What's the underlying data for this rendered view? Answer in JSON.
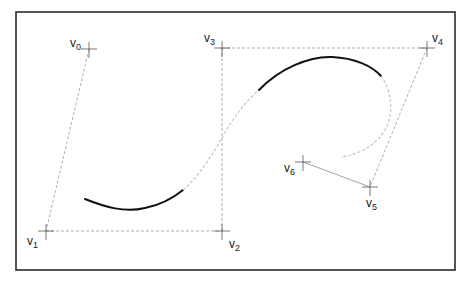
{
  "diagram": {
    "title": "",
    "frame": {
      "x": 16,
      "y": 12,
      "width": 439,
      "height": 258
    },
    "colors": {
      "frame": "#2a2a2a",
      "control_polygon": "#9a9a9a",
      "curve_active": "#111111",
      "curve_inactive": "#c4c4c4",
      "label": "#222222"
    },
    "control_points": [
      {
        "id": "v0",
        "letter": "V",
        "index": "0",
        "x": 89,
        "y": 49,
        "label_x": 70,
        "label_y": 47
      },
      {
        "id": "v1",
        "letter": "V",
        "index": "1",
        "x": 46,
        "y": 231,
        "label_x": 27,
        "label_y": 245
      },
      {
        "id": "v2",
        "letter": "V",
        "index": "2",
        "x": 222,
        "y": 231,
        "label_x": 229,
        "label_y": 248
      },
      {
        "id": "v3",
        "letter": "V",
        "index": "3",
        "x": 222,
        "y": 48,
        "label_x": 204,
        "label_y": 42
      },
      {
        "id": "v4",
        "letter": "V",
        "index": "4",
        "x": 427,
        "y": 48,
        "label_x": 432,
        "label_y": 42
      },
      {
        "id": "v5",
        "letter": "V",
        "index": "5",
        "x": 370,
        "y": 187,
        "label_x": 366,
        "label_y": 207
      },
      {
        "id": "v6",
        "letter": "V",
        "index": "6",
        "x": 303,
        "y": 162,
        "label_x": 284,
        "label_y": 172
      }
    ],
    "control_polygon_order": [
      "v0",
      "v1",
      "v2",
      "v3",
      "v4",
      "v5",
      "v6"
    ],
    "curve_segments": [
      {
        "style": "solid",
        "path": "M85,199 C105,207 125,213 145,208 C160,205 172,199 183,190"
      },
      {
        "style": "dashed",
        "path": "M183,190 C200,175 212,155 222,138 C233,118 245,102 259,90"
      },
      {
        "style": "solid",
        "path": "M259,90 C280,68 310,56 332,57 C355,58 372,66 381,76"
      },
      {
        "style": "dashed",
        "path": "M381,76 C392,90 394,115 385,130 C375,146 358,155 341,157"
      }
    ]
  }
}
